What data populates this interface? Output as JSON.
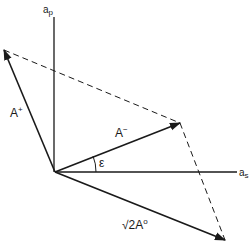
{
  "diagram": {
    "type": "vector-phasor-diagram",
    "stroke_color": "#1a1a1a",
    "background": "#ffffff",
    "origin": {
      "x": 55,
      "y": 172
    },
    "axes": {
      "vertical": {
        "label_base": "a",
        "label_sub": "p",
        "top": {
          "x": 54,
          "y": 17
        }
      },
      "horizontal": {
        "label_base": "a",
        "label_sub": "s",
        "end": {
          "x": 237,
          "y": 172
        }
      }
    },
    "vectors": [
      {
        "name": "A-plus",
        "label_base": "A",
        "label_sup": "+",
        "tip": {
          "x": 4,
          "y": 50
        }
      },
      {
        "name": "A-minus",
        "label_base": "A",
        "label_sup": "−",
        "tip": {
          "x": 180,
          "y": 123
        }
      },
      {
        "name": "sqrt2-A-zero",
        "label_prefix": "√2",
        "label_base": "A",
        "label_sup": "o",
        "tip": {
          "x": 225,
          "y": 240
        }
      }
    ],
    "dashed_lines": [
      {
        "from": {
          "x": 4,
          "y": 50
        },
        "to": {
          "x": 180,
          "y": 123
        }
      },
      {
        "from": {
          "x": 180,
          "y": 123
        },
        "to": {
          "x": 225,
          "y": 240
        }
      }
    ],
    "angle": {
      "label": "ε",
      "between": [
        "horizontal-axis",
        "A-minus"
      ]
    }
  }
}
